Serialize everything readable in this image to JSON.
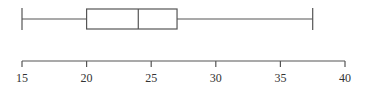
{
  "chart_data": {
    "type": "boxplot",
    "title": "",
    "xlabel": "",
    "ylabel": "",
    "orientation": "horizontal",
    "min": 15,
    "q1": 20,
    "median": 24,
    "q3": 27,
    "max": 37.5,
    "xlim": [
      15,
      40
    ],
    "ticks": [
      15,
      20,
      25,
      30,
      35,
      40
    ],
    "tick_labels": [
      "15",
      "20",
      "25",
      "30",
      "35",
      "40"
    ],
    "grid": false,
    "legend": null
  },
  "colors": {
    "stroke": "#555555",
    "text": "#333333",
    "background": "#ffffff"
  }
}
